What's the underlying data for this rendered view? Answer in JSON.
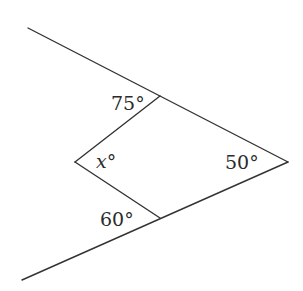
{
  "diagram": {
    "type": "geometry-angles",
    "points": {
      "top_left_end": [
        28,
        28
      ],
      "top_junction": [
        160,
        96
      ],
      "right_vertex": [
        288,
        162
      ],
      "bottom_junction": [
        160,
        218
      ],
      "bottom_left_end": [
        22,
        280
      ],
      "left_vertex": [
        75,
        162
      ]
    },
    "segments": [
      {
        "name": "upper-ray",
        "from": "top_left_end",
        "to": "right_vertex"
      },
      {
        "name": "lower-ray",
        "from": "bottom_left_end",
        "to": "right_vertex"
      },
      {
        "name": "upper-inner-segment",
        "from": "left_vertex",
        "to": "top_junction"
      },
      {
        "name": "lower-inner-segment",
        "from": "left_vertex",
        "to": "bottom_junction"
      }
    ],
    "labels": {
      "top_angle": {
        "text": "75°",
        "x": 111,
        "y": 110
      },
      "left_angle": {
        "text": "x°",
        "x": 96,
        "y": 168
      },
      "right_angle": {
        "text": "50°",
        "x": 225,
        "y": 169
      },
      "bottom_angle": {
        "text": "60°",
        "x": 100,
        "y": 226
      }
    },
    "line_color": "#333333",
    "text_color": "#2b2b2b",
    "background": "#ffffff"
  }
}
